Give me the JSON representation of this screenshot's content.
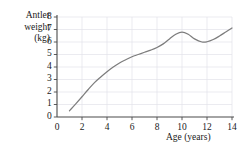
{
  "chart_data": {
    "type": "line",
    "title": "",
    "subtitle": "",
    "xlabel": "Age (years)",
    "ylabel": "Antler weight (kg)",
    "ylabel_lines": [
      "Antler",
      "weight",
      "(kg)"
    ],
    "xlim": [
      0,
      14
    ],
    "ylim": [
      0,
      8
    ],
    "xticks": [
      0,
      2,
      4,
      6,
      8,
      10,
      12,
      14
    ],
    "xtick_labels": [
      "0",
      "2",
      "4",
      "6",
      "8",
      "10",
      "12",
      "14"
    ],
    "yticks": [
      0,
      1,
      2,
      3,
      4,
      5,
      6,
      7,
      8
    ],
    "ytick_labels": [
      "0",
      "1",
      "2",
      "3",
      "4",
      "5",
      "6",
      "7",
      "8"
    ],
    "grid": true,
    "grid_x_step": 2,
    "grid_y_step": 1,
    "legend": null,
    "legend_position": "none",
    "series": [
      {
        "name": "Antler weight",
        "color": "#7d7d7d",
        "x": [
          1.0,
          1.5,
          2.0,
          2.5,
          3.0,
          3.5,
          4.0,
          4.5,
          5.0,
          5.5,
          6.0,
          6.5,
          7.0,
          7.5,
          8.0,
          8.5,
          9.0,
          9.5,
          10.0,
          10.5,
          11.0,
          11.6,
          12.0,
          12.5,
          13.0,
          13.5,
          14.0
        ],
        "y": [
          0.5,
          1.05,
          1.62,
          2.2,
          2.75,
          3.2,
          3.62,
          4.0,
          4.32,
          4.58,
          4.82,
          5.0,
          5.18,
          5.35,
          5.56,
          5.85,
          6.25,
          6.62,
          6.8,
          6.62,
          6.25,
          6.0,
          6.02,
          6.2,
          6.48,
          6.8,
          7.12
        ]
      }
    ],
    "colors": {
      "curve": "#7d7d7d",
      "axis": "#4a4a4a",
      "grid": "#e2e2ea",
      "text": "#1a1a1a",
      "background": "#ffffff"
    }
  }
}
